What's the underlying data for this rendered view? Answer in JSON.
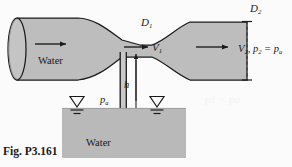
{
  "figure": {
    "caption": "Fig. P3.161",
    "type": "engineering-diagram"
  },
  "labels": {
    "d1": "D",
    "d1_sub": "1",
    "d2": "D",
    "d2_sub": "2",
    "v1": "V",
    "v1_sub": "1",
    "h": "h",
    "pa": "p",
    "pa_sub": "a",
    "water_pipe": "Water",
    "water_reservoir": "Water",
    "exit_v": "V",
    "exit_v_sub": "2",
    "exit_comma": ", ",
    "exit_p": "p",
    "exit_p_sub": "2",
    "exit_eq": " = ",
    "exit_pa": "p",
    "exit_pa_sub": "a"
  },
  "smudges": {
    "right_margin": "p1 < pa"
  },
  "colors": {
    "fluid_gray": "#bdbdbd",
    "reservoir_gray": "#b9b9b9",
    "outline": "#1a1a1a",
    "background": "#fbfbfb",
    "smudge": "#f2f2f2"
  },
  "geometry": {
    "pipe_inlet_diameter_label": "D1 upstream duct",
    "throat_label": "D1 throat",
    "exit_plane_label": "D2 exit, dashed",
    "standpipe_height_label": "h"
  }
}
